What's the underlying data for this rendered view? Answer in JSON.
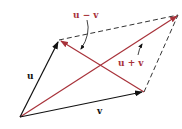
{
  "diagram": {
    "colors": {
      "black": "#111111",
      "red": "#a8323a",
      "dashed": "#333333"
    },
    "labels": {
      "u": "u",
      "v": "v",
      "u_minus_v": "u − v",
      "u_plus_v": "u + v"
    },
    "points": {
      "origin": [
        20,
        117
      ],
      "u_tip": [
        59,
        40
      ],
      "v_tip": [
        144,
        92
      ],
      "sum_tip": [
        178,
        15
      ]
    },
    "vectors": [
      {
        "name": "u",
        "from": "origin",
        "to": "u_tip",
        "color": "black",
        "style": "solid"
      },
      {
        "name": "v",
        "from": "origin",
        "to": "v_tip",
        "color": "black",
        "style": "solid"
      },
      {
        "name": "u + v",
        "from": "origin",
        "to": "sum_tip",
        "color": "red",
        "style": "solid"
      },
      {
        "name": "u − v",
        "from": "v_tip",
        "to": "u_tip",
        "color": "red",
        "style": "solid"
      },
      {
        "name": "edge-top",
        "from": "u_tip",
        "to": "sum_tip",
        "color": "dashed",
        "style": "dashed"
      },
      {
        "name": "edge-right",
        "from": "v_tip",
        "to": "sum_tip",
        "color": "dashed",
        "style": "dashed"
      }
    ]
  }
}
